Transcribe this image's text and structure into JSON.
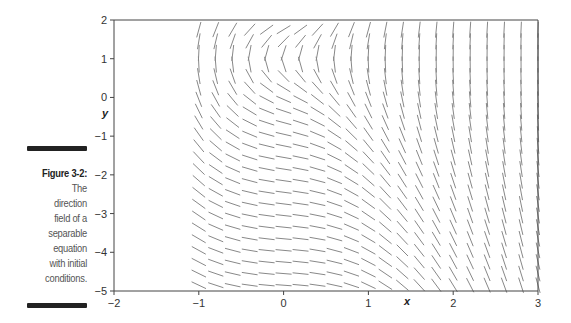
{
  "caption": {
    "figure_label": "Figure 3-2:",
    "lines": [
      "The",
      "direction",
      "field of a",
      "separable",
      "equation",
      "with initial",
      "conditions."
    ]
  },
  "chart_data": {
    "type": "direction_field",
    "title": "",
    "xlabel": "x",
    "ylabel": "y",
    "xlim": [
      -2,
      3
    ],
    "ylim": [
      -5,
      2
    ],
    "xticks": [
      -2,
      -1,
      0,
      1,
      2,
      3
    ],
    "yticks": [
      2,
      1,
      0,
      -1,
      -2,
      -3,
      -4,
      -5
    ],
    "xtick_labels": [
      "−2",
      "−1",
      "0",
      "1",
      "2",
      "3"
    ],
    "ytick_labels": [
      "2",
      "1",
      "0",
      "−1",
      "−2",
      "−3",
      "−4",
      "−5"
    ],
    "grid": false,
    "field": {
      "x_range": [
        -1,
        3
      ],
      "x_step": 0.2,
      "y_range": [
        -4.85,
        1.9
      ],
      "y_step": 0.3,
      "approx_slope": "(5x^2+1)/(y-1)",
      "notes": "Segments vertical near y=1; positive slopes above y=1, negative below; steeper toward larger x"
    }
  }
}
